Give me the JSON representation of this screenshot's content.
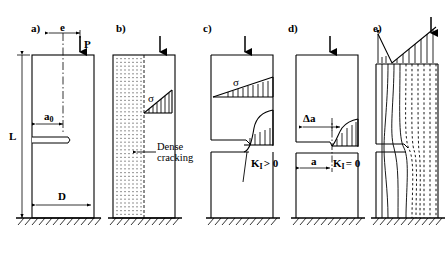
{
  "figure": {
    "width": 447,
    "height": 260,
    "background": "#ffffff",
    "line_color": "#000000"
  },
  "panels": [
    {
      "id": "a",
      "label": "a)",
      "description": "Initial notched column with eccentric load",
      "labels": {
        "eccentricity": "e",
        "load": "P",
        "notch_depth": "a0",
        "notch_depth_base": "a",
        "notch_depth_sub": "0",
        "length": "L",
        "width": "D"
      },
      "features": [
        "centerline",
        "notch",
        "ground-hatching",
        "dimension-arrows"
      ]
    },
    {
      "id": "b",
      "label": "b)",
      "description": "Dense cracking zone develops on tension side",
      "labels": {
        "stress": "σ",
        "annotation_line1": "Dense",
        "annotation_line2": "cracking"
      },
      "features": [
        "dotted-crack-zone",
        "triangular-stress-block",
        "load-arrow",
        "ground-hatching"
      ]
    },
    {
      "id": "c",
      "label": "c)",
      "description": "Crack propagates, stress intensity factor positive",
      "labels": {
        "stress": "σ",
        "sif_base": "K",
        "sif_sub": "I",
        "sif_relation": "> 0",
        "sif_full": "K_I > 0"
      },
      "features": [
        "upper-stress-profile",
        "lower-stress-profile",
        "crack-line",
        "load-arrow",
        "ground-hatching"
      ]
    },
    {
      "id": "d",
      "label": "d)",
      "description": "Crack arrest, stress intensity factor zero",
      "labels": {
        "crack_growth": "Δa",
        "crack_length": "a",
        "sif_base": "K",
        "sif_sub": "I",
        "sif_relation": "= 0",
        "sif_full": "K_I = 0"
      },
      "features": [
        "delta-a-dimension",
        "a-dimension",
        "stress-profile",
        "load-arrow",
        "ground-hatching"
      ]
    },
    {
      "id": "e",
      "label": "e)",
      "description": "Stress trajectories flowing around the notch",
      "labels": {},
      "features": [
        "v-shaped-stress-diagram",
        "solid-flow-lines",
        "dashed-flow-lines",
        "load-arrow",
        "ground-hatching"
      ]
    }
  ]
}
